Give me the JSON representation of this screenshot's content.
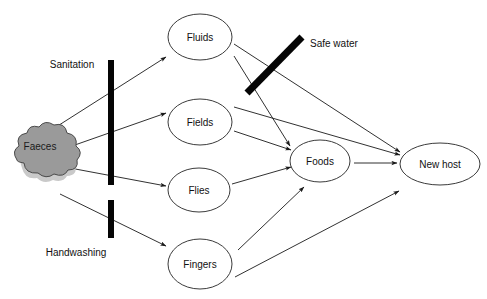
{
  "diagram": {
    "source_node": {
      "id": "faeces",
      "label": "Faeces",
      "shape": "cloud",
      "fill_color": "#9a9a9a",
      "stroke_color": "#4a4a4a",
      "cx": 40,
      "cy": 144
    },
    "nodes": [
      {
        "id": "fluids",
        "label": "Fluids",
        "cx": 200,
        "cy": 37,
        "rx": 32,
        "ry": 23
      },
      {
        "id": "fields",
        "label": "Fields",
        "cx": 200,
        "cy": 122,
        "rx": 32,
        "ry": 23
      },
      {
        "id": "flies",
        "label": "Flies",
        "cx": 199,
        "cy": 190,
        "rx": 31,
        "ry": 22
      },
      {
        "id": "fingers",
        "label": "Fingers",
        "cx": 200,
        "cy": 264,
        "rx": 32,
        "ry": 25
      },
      {
        "id": "foods",
        "label": "Foods",
        "cx": 320,
        "cy": 161,
        "rx": 30,
        "ry": 21
      },
      {
        "id": "new_host",
        "label": "New host",
        "cx": 440,
        "cy": 164,
        "rx": 40,
        "ry": 21
      }
    ],
    "barriers": [
      {
        "id": "sanitation",
        "label": "Sanitation",
        "label_x": 72,
        "label_y": 65,
        "type": "vertical-bar",
        "x1": 111,
        "y1": 60,
        "x2": 111,
        "y2": 185,
        "thickness": 6,
        "color": "#050505"
      },
      {
        "id": "handwashing",
        "label": "Handwashing",
        "label_x": 76,
        "label_y": 253,
        "type": "vertical-bar",
        "x1": 111,
        "y1": 200,
        "x2": 111,
        "y2": 238,
        "thickness": 6,
        "color": "#050505"
      },
      {
        "id": "safe_water",
        "label": "Safe water",
        "label_x": 310,
        "label_y": 44,
        "type": "diagonal-bar",
        "x1": 302,
        "y1": 37,
        "x2": 247,
        "y2": 93,
        "thickness": 7,
        "color": "#050505"
      }
    ],
    "arrows": [
      {
        "id": "faeces-to-fluids",
        "from": "faeces",
        "to": "fluids",
        "x1": 56,
        "y1": 127,
        "x2": 166,
        "y2": 57
      },
      {
        "id": "faeces-to-fields",
        "from": "faeces",
        "to": "fields",
        "x1": 72,
        "y1": 146,
        "x2": 166,
        "y2": 113
      },
      {
        "id": "faeces-to-flies",
        "from": "faeces",
        "to": "flies",
        "x1": 70,
        "y1": 168,
        "x2": 166,
        "y2": 186
      },
      {
        "id": "faeces-to-fingers",
        "from": "faeces",
        "to": "fingers",
        "x1": 60,
        "y1": 194,
        "x2": 166,
        "y2": 246
      },
      {
        "id": "fluids-to-new-host",
        "from": "fluids",
        "to": "new_host",
        "x1": 234,
        "y1": 44,
        "x2": 400,
        "y2": 152
      },
      {
        "id": "fluids-to-foods-cross",
        "from": "fluids",
        "to": "foods",
        "x1": 234,
        "y1": 56,
        "x2": 288,
        "y2": 145
      },
      {
        "id": "fields-to-new-host",
        "from": "fields",
        "to": "new_host",
        "x1": 234,
        "y1": 107,
        "x2": 400,
        "y2": 155
      },
      {
        "id": "fields-to-foods",
        "from": "fields",
        "to": "foods",
        "x1": 234,
        "y1": 131,
        "x2": 290,
        "y2": 150
      },
      {
        "id": "flies-to-foods",
        "from": "flies",
        "to": "foods",
        "x1": 232,
        "y1": 183,
        "x2": 290,
        "y2": 166
      },
      {
        "id": "fingers-to-foods",
        "from": "fingers",
        "to": "foods",
        "x1": 238,
        "y1": 248,
        "x2": 303,
        "y2": 186
      },
      {
        "id": "fingers-to-new-host",
        "from": "fingers",
        "to": "new_host",
        "x1": 235,
        "y1": 274,
        "x2": 398,
        "y2": 190
      },
      {
        "id": "foods-to-new-host",
        "from": "foods",
        "to": "new_host",
        "x1": 354,
        "y1": 163,
        "x2": 397,
        "y2": 163
      },
      {
        "id": "safewater-cross-upper",
        "from": "fluids",
        "to": "new_host",
        "x1": 247,
        "y1": 40,
        "x2": 296,
        "y2": 88
      }
    ]
  }
}
